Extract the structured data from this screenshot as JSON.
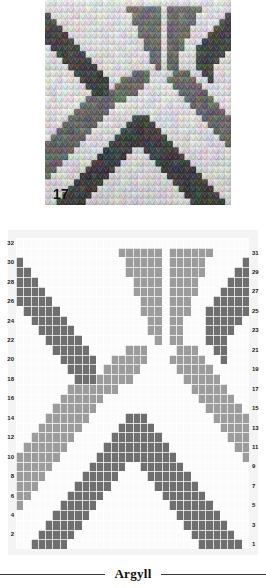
{
  "swatch": {
    "number_label": "17",
    "alt_name": "knitted-argyll-swatch"
  },
  "caption": {
    "title": "Argyll",
    "left_rule": "rule",
    "right_rule": "rule"
  },
  "chart_data": {
    "type": "heatmap",
    "title": "Argyll",
    "xlabel": "",
    "ylabel": "",
    "grid": true,
    "rows": 32,
    "cols": 32,
    "legend": [
      {
        "key": "0",
        "name": "background",
        "color": "#fbfbfb"
      },
      {
        "key": "1",
        "name": "dark-yarn",
        "color": "#6f6f6f"
      },
      {
        "key": "2",
        "name": "light-yarn",
        "color": "#9c9c9c"
      }
    ],
    "row_labels_left": [
      32,
      30,
      28,
      26,
      24,
      22,
      20,
      18,
      16,
      14,
      12,
      10,
      8,
      6,
      4,
      2
    ],
    "row_labels_right": [
      31,
      29,
      27,
      25,
      23,
      21,
      19,
      17,
      15,
      13,
      11,
      9,
      7,
      5,
      3,
      1
    ],
    "cells": [
      "00000000000000000000000000000000",
      "00000000000000222222022222200000",
      "10000000000000022222022222000001",
      "11000000000000022222022222000011",
      "11100000000000002222022220000111",
      "11110000000000002222022220001111",
      "11111000000000000222022200011111",
      "01111100000000000222022200111111",
      "00111110000000000022022000111110",
      "00011111000000000022022000111100",
      "00001111100000000002022000111000",
      "00000111110000022200002220011000",
      "00000011111002222200022222001000",
      "00000001111022222000002222200000",
      "00000000111222220000000222220000",
      "00000002222222000000000022222000",
      "00000022222200000000000002222200",
      "00000222222000000000000000222220",
      "00002222220000011100000000022222",
      "00022222200000111110000000002222",
      "00222222000001111111000000000222",
      "02222220000011111111100000000022",
      "22222200000111111111110000000002",
      "22222000001111100111111000000000",
      "22220000011111000011111100000000",
      "22200000111110000001111110000000",
      "22000001111100000000111111000000",
      "20000011111000000000011111100000",
      "00000111110000000000001111110000",
      "00001111100000000000000111111000",
      "00011111000000000000000011111100",
      "00111110000000000000000001111110",
      "01111100000000000000000000111111"
    ]
  }
}
